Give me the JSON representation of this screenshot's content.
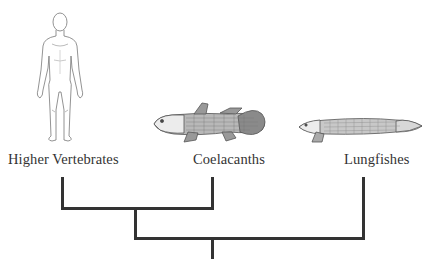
{
  "diagram": {
    "type": "cladogram",
    "taxa": [
      {
        "name": "Higher Vertebrates",
        "illustration": "human-figure"
      },
      {
        "name": "Coelacanths",
        "illustration": "coelacanth-fish"
      },
      {
        "name": "Lungfishes",
        "illustration": "lungfish"
      }
    ],
    "tree": "((Higher Vertebrates, Coelacanths), Lungfishes)",
    "line_color": "#333333"
  }
}
